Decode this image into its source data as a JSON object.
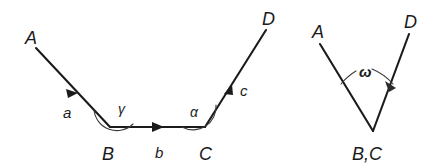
{
  "figure": {
    "background_color": "#ffffff",
    "stroke_color": "#1b1b1b",
    "arc_color": "#3a3a3a",
    "left_diagram": {
      "name": "open polygon path A-B-C-D",
      "points": {
        "A": {
          "label": "A",
          "x": 36,
          "y": 48
        },
        "B": {
          "label": "B",
          "x": 110,
          "y": 127
        },
        "C": {
          "label": "C",
          "x": 205,
          "y": 127
        },
        "D": {
          "label": "D",
          "x": 266,
          "y": 30
        }
      },
      "segments": [
        {
          "label": "a",
          "from": "A",
          "to": "B",
          "arrow": true,
          "label_x": 63,
          "label_y": 118
        },
        {
          "label": "b",
          "from": "B",
          "to": "C",
          "arrow": true,
          "label_x": 155,
          "label_y": 158
        },
        {
          "label": "c",
          "from": "C",
          "to": "D",
          "arrow": true,
          "label_x": 240,
          "label_y": 96
        }
      ],
      "angles": [
        {
          "label": "γ",
          "at": "B",
          "label_x": 118,
          "label_y": 114
        },
        {
          "label": "α",
          "at": "C",
          "label_x": 190,
          "label_y": 117
        }
      ],
      "point_labels": [
        {
          "label": "A",
          "x": 25,
          "y": 44
        },
        {
          "label": "B",
          "x": 102,
          "y": 160
        },
        {
          "label": "C",
          "x": 199,
          "y": 160
        },
        {
          "label": "D",
          "x": 262,
          "y": 25
        }
      ]
    },
    "right_diagram": {
      "name": "resultant angle between ray A and ray D at coincident vertex B,C",
      "points": {
        "A": {
          "label": "A",
          "x": 320,
          "y": 42
        },
        "D": {
          "label": "D",
          "x": 409,
          "y": 32
        },
        "BC": {
          "label": "B,C",
          "x": 373,
          "y": 131
        }
      },
      "segments": [
        {
          "label": "",
          "from": "BC",
          "to": "A",
          "arrow": false
        },
        {
          "label": "",
          "from": "BC",
          "to": "D",
          "arrow": false
        }
      ],
      "angles": [
        {
          "label": "ω",
          "at": "BC",
          "label_x": 363,
          "label_y": 78,
          "arrow": true
        }
      ],
      "point_labels": [
        {
          "label": "A",
          "x": 312,
          "y": 38
        },
        {
          "label": "D",
          "x": 404,
          "y": 28
        },
        {
          "label": "B,C",
          "x": 352,
          "y": 160
        }
      ]
    }
  }
}
